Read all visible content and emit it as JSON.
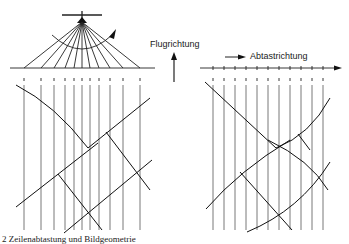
{
  "labels": {
    "flight_direction": "Flugrichtung",
    "scan_direction": "Abtastrichtung",
    "caption": "2 Zeilenabtastung und Bildgeometrie"
  },
  "diagram": {
    "left_panel": {
      "description": "Panoramic scanner geometry: aircraft at apex with fan of scan rays to the ground line, producing vertical scan lines with compressed spacing at the edges and distorted straight features",
      "scan_line_x": [
        24,
        41,
        54,
        65,
        74,
        82,
        90,
        99,
        110,
        123,
        140
      ]
    },
    "right_panel": {
      "description": "Equally spaced scan lines along scan direction with curved distorted features",
      "scan_line_x": [
        213,
        224,
        235,
        246,
        257,
        268,
        279,
        290,
        301,
        312,
        323
      ]
    },
    "colors": {
      "line": "#222222",
      "background": "#ffffff"
    }
  }
}
